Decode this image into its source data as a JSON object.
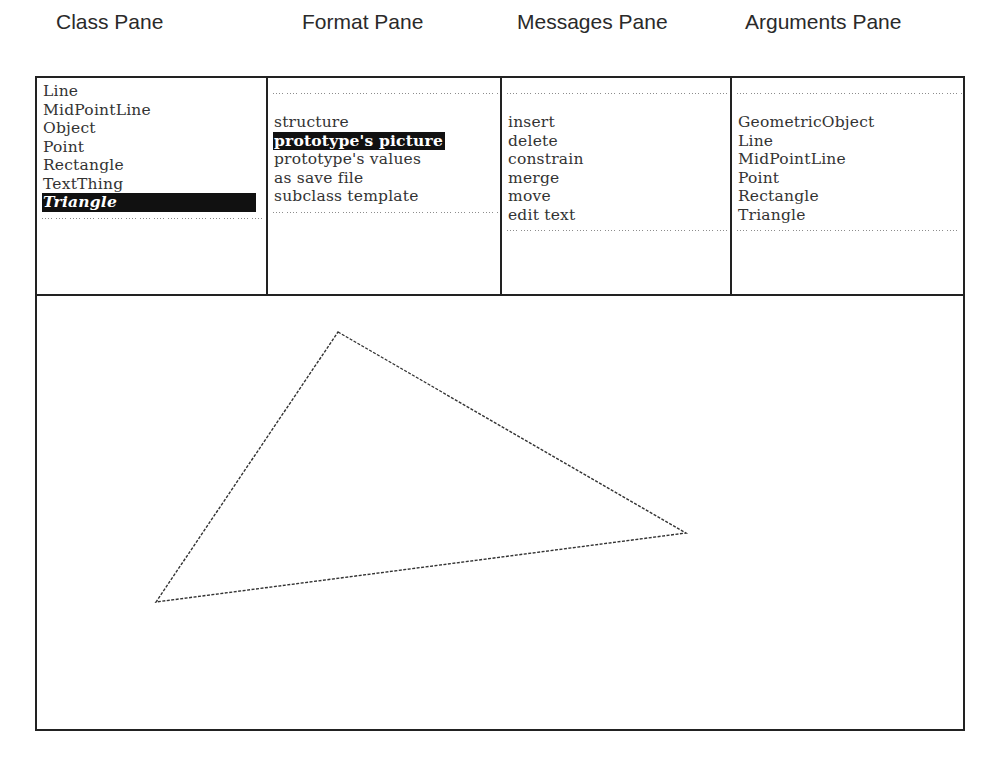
{
  "captions": {
    "class_pane": "Class Pane",
    "format_pane": "Format Pane",
    "messages_pane": "Messages Pane",
    "arguments_pane": "Arguments Pane"
  },
  "class_pane": {
    "items": [
      "Line",
      "MidPointLine",
      "Object",
      "Point",
      "Rectangle",
      "TextThing",
      "Triangle"
    ],
    "selected": "Triangle"
  },
  "format_pane": {
    "items": [
      "structure",
      "prototype's picture",
      "prototype's values",
      "as save file",
      "subclass template"
    ],
    "selected": "prototype's picture"
  },
  "messages_pane": {
    "items": [
      "insert",
      "delete",
      "constrain",
      "merge",
      "move",
      "edit text"
    ]
  },
  "arguments_pane": {
    "items": [
      "GeometricObject",
      "Line",
      "MidPointLine",
      "Point",
      "Rectangle",
      "Triangle"
    ]
  },
  "picture": {
    "shape": "triangle",
    "vertices": [
      [
        301,
        36
      ],
      [
        649,
        237
      ],
      [
        119,
        306
      ]
    ],
    "stroke": "#333333"
  }
}
